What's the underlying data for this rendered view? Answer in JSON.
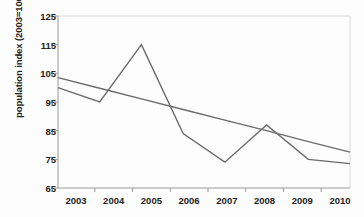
{
  "chart_data": {
    "type": "line",
    "title": "",
    "xlabel": "",
    "ylabel": "population index (2003=100)",
    "categories": [
      "2003",
      "2004",
      "2005",
      "2006",
      "2007",
      "2008",
      "2009",
      "2010"
    ],
    "x": [
      2003,
      2004,
      2005,
      2006,
      2007,
      2008,
      2009,
      2010
    ],
    "xlim": [
      2003,
      2010
    ],
    "ylim": [
      65,
      125
    ],
    "yticks": [
      65,
      75,
      85,
      95,
      105,
      115,
      125
    ],
    "xticks": [
      "2003",
      "2004",
      "2005",
      "2006",
      "2007",
      "2008",
      "2009",
      "2010"
    ],
    "grid": false,
    "legend": "none",
    "series": [
      {
        "name": "population index",
        "type": "line",
        "color": "#6b6b6b",
        "values": [
          100,
          95,
          115,
          84,
          74,
          87,
          75,
          73.5
        ]
      },
      {
        "name": "linear trend",
        "type": "line",
        "color": "#6b6b6b",
        "values": [
          103.5,
          99.8,
          96.1,
          92.4,
          88.7,
          85.0,
          81.2,
          77.5
        ]
      }
    ]
  },
  "axis": {
    "y_label": "population index (2003=100)",
    "y_tick_labels": [
      "125",
      "115",
      "105",
      "95",
      "85",
      "75",
      "65"
    ],
    "x_tick_labels": [
      "2003",
      "2004",
      "2005",
      "2006",
      "2007",
      "2008",
      "2009",
      "2010"
    ]
  },
  "colors": {
    "line": "#6b6b6b",
    "axis": "#8a8a8a",
    "text": "#222222",
    "background": "#fdfdfd"
  }
}
